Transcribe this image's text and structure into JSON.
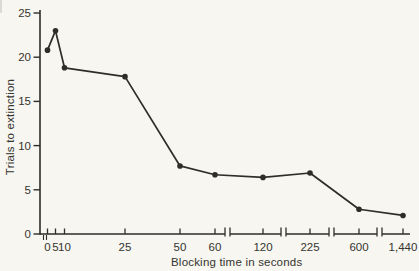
{
  "figure": {
    "background_color": "#f7f6f1",
    "ink_color": "#2e2d2a"
  },
  "chart_data": {
    "type": "line",
    "title": "",
    "xlabel": "Blocking time in seconds",
    "ylabel": "Trials to extinction",
    "categories": [
      "0",
      "5",
      "10",
      "25",
      "50",
      "60",
      "120",
      "225",
      "600",
      "1,440"
    ],
    "values": [
      20.8,
      23.0,
      18.8,
      17.8,
      7.7,
      6.7,
      6.4,
      6.9,
      2.8,
      2.1
    ],
    "series_name": "trials-to-extinction",
    "y_ticks": [
      0,
      5,
      10,
      15,
      20,
      25
    ],
    "ylim": [
      0,
      25
    ],
    "grid": false,
    "legend": null,
    "marker": "filled-circle",
    "x_axis": {
      "scale": "broken-categorical",
      "breaks_after": [
        "60",
        "120",
        "225",
        "600"
      ],
      "origin_scale_break": true
    },
    "layout": {
      "x_px": [
        47.5,
        55.5,
        64.5,
        125,
        180,
        215,
        263,
        310,
        359,
        403
      ],
      "y0_px": 234,
      "px_per_unit": 8.84,
      "axis_x_px": 40,
      "axis_top_px": 10,
      "segments_px": [
        [
          40,
          225
        ],
        [
          230,
          281
        ],
        [
          286,
          329
        ],
        [
          334,
          377
        ],
        [
          382,
          410
        ]
      ],
      "break_bar_px": [
        225,
        230,
        281,
        286,
        329,
        334,
        377,
        382
      ],
      "origin_break_px": [
        43.5,
        46.5
      ],
      "y_tick_len_px": 6.5,
      "x_tick_len_px": 5.5,
      "marker_radius_px": 2.8,
      "line_width_px": 1.7
    }
  }
}
